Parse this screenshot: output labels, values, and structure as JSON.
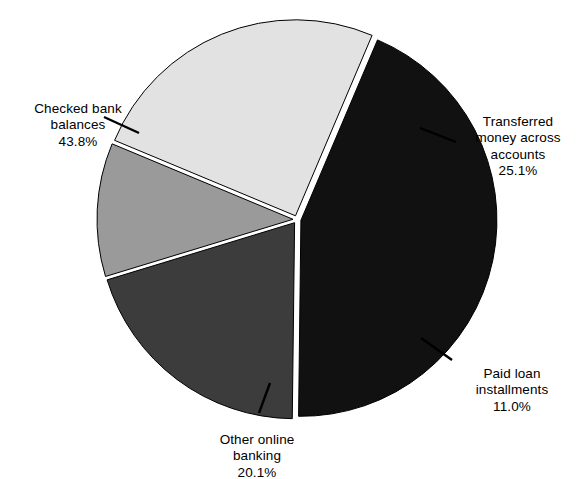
{
  "chart_data": {
    "type": "pie",
    "title": "",
    "subtitle": "",
    "xlabel": "",
    "ylabel": "",
    "legend_position": "none",
    "grid": false,
    "units": "percent",
    "total": 100.0,
    "categories": [
      "Checked bank balances",
      "Transferred money across accounts",
      "Paid loan installments",
      "Other online banking"
    ],
    "values": [
      43.8,
      25.1,
      11.0,
      20.1
    ],
    "slices": [
      {
        "label": "Checked bank\nbalances",
        "label_flat": "Checked bank balances",
        "value": 43.8,
        "value_text": "43.8%",
        "color": "#111111",
        "angle_deg": 157.7,
        "start_deg": -67.0,
        "end_deg": 90.7
      },
      {
        "label": "Transferred\nmoney across\naccounts",
        "label_flat": "Transferred money across accounts",
        "value": 25.1,
        "value_text": "25.1%",
        "color": "#e2e2e2",
        "angle_deg": 90.4,
        "start_deg": -157.4,
        "end_deg": -67.0
      },
      {
        "label": "Paid loan\ninstallments",
        "label_flat": "Paid loan installments",
        "value": 11.0,
        "value_text": "11.0%",
        "color": "#9a9a9a",
        "angle_deg": 39.6,
        "start_deg": -197.0,
        "end_deg": -157.4
      },
      {
        "label": "Other online\nbanking",
        "label_flat": "Other online banking",
        "value": 20.1,
        "value_text": "20.1%",
        "color": "#3c3c3c",
        "angle_deg": 72.4,
        "start_deg": -269.4,
        "end_deg": -197.0
      }
    ],
    "palette": [
      "#111111",
      "#e2e2e2",
      "#9a9a9a",
      "#3c3c3c"
    ],
    "background_color": "#ffffff",
    "separator_color": "#ffffff",
    "outline_color": "#000000"
  },
  "labels": {
    "checked": {
      "name": "Checked bank\nbalances",
      "value": "43.8%"
    },
    "transferred": {
      "name": "Transferred\nmoney across\naccounts",
      "value": "25.1%"
    },
    "paid": {
      "name": "Paid loan\ninstallments",
      "value": "11.0%"
    },
    "other": {
      "name": "Other online\nbanking",
      "value": "20.1%"
    }
  }
}
